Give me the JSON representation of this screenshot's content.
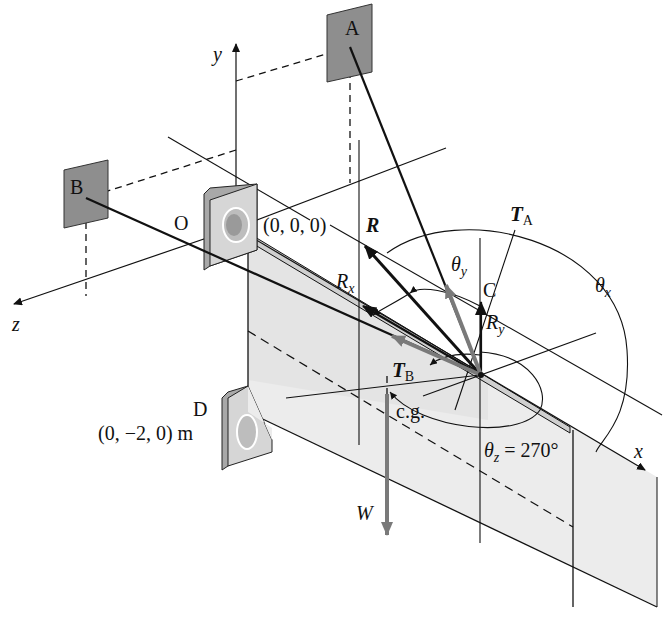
{
  "figure": {
    "colors": {
      "line": "#111111",
      "anchor_plate": "#8e8e8e",
      "door_panel": "#e6e6e6",
      "gray_force": "#7a7a7a",
      "background": "#ffffff"
    }
  },
  "axes": {
    "x": "x",
    "y": "y",
    "z": "z"
  },
  "points": {
    "A": "A",
    "B": "B",
    "C": "C",
    "D": "D",
    "O": "O"
  },
  "coordinates": {
    "origin": "(0, 0, 0)",
    "D": "(0, −2, 0) m"
  },
  "forces": {
    "R": "R",
    "Rx": {
      "main": "R",
      "sub": "x"
    },
    "Ry": {
      "main": "R",
      "sub": "y"
    },
    "TA": {
      "main": "T",
      "sub": "A"
    },
    "TB": {
      "main": "T",
      "sub": "B"
    },
    "W": "W"
  },
  "angles": {
    "theta_x": {
      "main": "θ",
      "sub": "x"
    },
    "theta_y": {
      "main": "θ",
      "sub": "y"
    },
    "theta_z": {
      "main": "θ",
      "sub": "z",
      "value": " = 270°"
    }
  },
  "labels": {
    "cg": "c.g."
  }
}
